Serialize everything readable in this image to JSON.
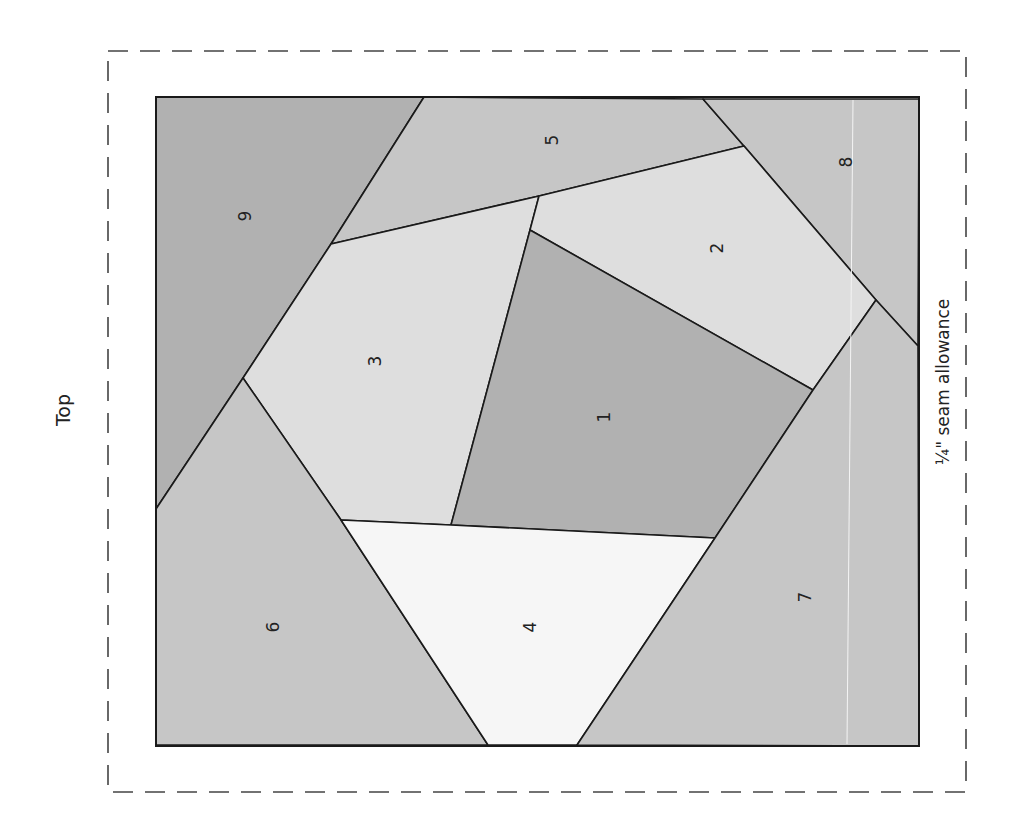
{
  "labels": {
    "top": "Top",
    "seam_allowance": "¼\" seam allowance"
  },
  "colors": {
    "dark": "#b1b1b1",
    "medium": "#c6c6c6",
    "light": "#dedede",
    "white": "#f6f6f6",
    "line": "#1a1a1a",
    "dash": "#444444"
  },
  "pieces": [
    {
      "number": "1",
      "shade": "dark"
    },
    {
      "number": "2",
      "shade": "light"
    },
    {
      "number": "3",
      "shade": "light"
    },
    {
      "number": "4",
      "shade": "white"
    },
    {
      "number": "5",
      "shade": "medium"
    },
    {
      "number": "6",
      "shade": "medium"
    },
    {
      "number": "7",
      "shade": "medium"
    },
    {
      "number": "8",
      "shade": "medium"
    },
    {
      "number": "9",
      "shade": "dark"
    }
  ]
}
